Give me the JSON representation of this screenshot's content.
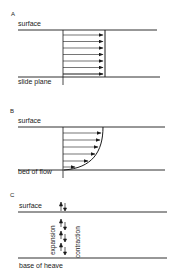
{
  "panels": [
    {
      "id": "A",
      "letter": "A",
      "top_label": "surface",
      "bottom_label": "slide plane",
      "profile": "uniform",
      "arrow_count": 7
    },
    {
      "id": "B",
      "letter": "B",
      "top_label": "surface",
      "bottom_label": "bed of flow",
      "profile": "parabolic",
      "arrow_count": 6
    },
    {
      "id": "C",
      "letter": "C",
      "top_label": "surface",
      "bottom_label": "base of heave",
      "left_vertical_label": "expansion",
      "right_vertical_label": "contraction",
      "profile": "heave",
      "arrow_pairs": 4
    }
  ],
  "colors": {
    "line": "#1a1a1a",
    "background": "#ffffff"
  }
}
